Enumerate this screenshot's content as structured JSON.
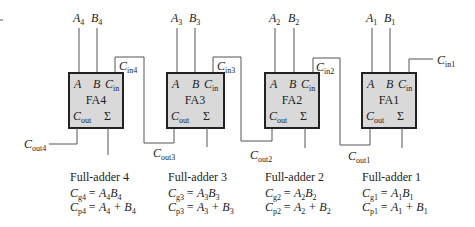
{
  "diagram": {
    "colors": {
      "box_fill": "#d9d9d9",
      "box_stroke": "#222222",
      "wire": "#555555",
      "text": "#222222"
    },
    "adders": [
      {
        "id": "FA4",
        "name": "FA4",
        "caption": "Full-adder 4",
        "input_a": "A",
        "input_a_sub": "4",
        "input_b": "B",
        "input_b_sub": "4",
        "port_a": "A",
        "port_b": "B",
        "port_cin": "C",
        "port_cin_sub": "in",
        "port_cout": "C",
        "port_cout_sub": "out",
        "port_sum": "Σ",
        "cin_label": "C",
        "cin_label_sub": "in4",
        "cout_label": "C",
        "cout_label_sub": "out4",
        "gen_lhs": "C",
        "gen_lhs_sub": "g4",
        "gen_rhs": "= A",
        "gen_rhs_sub1": "4",
        "gen_rhs2": "B",
        "gen_rhs_sub2": "4",
        "prop_lhs": "C",
        "prop_lhs_sub": "p4",
        "prop_rhs": "= A",
        "prop_rhs_sub1": "4",
        "prop_rhs2": " + B",
        "prop_rhs_sub2": "4"
      },
      {
        "id": "FA3",
        "name": "FA3",
        "caption": "Full-adder 3",
        "input_a": "A",
        "input_a_sub": "3",
        "input_b": "B",
        "input_b_sub": "3",
        "port_a": "A",
        "port_b": "B",
        "port_cin": "C",
        "port_cin_sub": "in",
        "port_cout": "C",
        "port_cout_sub": "out",
        "port_sum": "Σ",
        "cin_label": "C",
        "cin_label_sub": "in3",
        "cout_label": "C",
        "cout_label_sub": "out3",
        "gen_lhs": "C",
        "gen_lhs_sub": "g3",
        "gen_rhs": "= A",
        "gen_rhs_sub1": "3",
        "gen_rhs2": "B",
        "gen_rhs_sub2": "3",
        "prop_lhs": "C",
        "prop_lhs_sub": "p3",
        "prop_rhs": "= A",
        "prop_rhs_sub1": "3",
        "prop_rhs2": " + B",
        "prop_rhs_sub2": "3"
      },
      {
        "id": "FA2",
        "name": "FA2",
        "caption": "Full-adder 2",
        "input_a": "A",
        "input_a_sub": "2",
        "input_b": "B",
        "input_b_sub": "2",
        "port_a": "A",
        "port_b": "B",
        "port_cin": "C",
        "port_cin_sub": "in",
        "port_cout": "C",
        "port_cout_sub": "out",
        "port_sum": "Σ",
        "cin_label": "C",
        "cin_label_sub": "in2",
        "cout_label": "C",
        "cout_label_sub": "out2",
        "gen_lhs": "C",
        "gen_lhs_sub": "g2",
        "gen_rhs": "= A",
        "gen_rhs_sub1": "2",
        "gen_rhs2": "B",
        "gen_rhs_sub2": "2",
        "prop_lhs": "C",
        "prop_lhs_sub": "p2",
        "prop_rhs": "= A",
        "prop_rhs_sub1": "2",
        "prop_rhs2": " + B",
        "prop_rhs_sub2": "2"
      },
      {
        "id": "FA1",
        "name": "FA1",
        "caption": "Full-adder 1",
        "input_a": "A",
        "input_a_sub": "1",
        "input_b": "B",
        "input_b_sub": "1",
        "port_a": "A",
        "port_b": "B",
        "port_cin": "C",
        "port_cin_sub": "in",
        "port_cout": "C",
        "port_cout_sub": "out",
        "port_sum": "Σ",
        "cin_label": "C",
        "cin_label_sub": "in1",
        "cout_label": "C",
        "cout_label_sub": "out1",
        "gen_lhs": "C",
        "gen_lhs_sub": "g1",
        "gen_rhs": "= A",
        "gen_rhs_sub1": "1",
        "gen_rhs2": "B",
        "gen_rhs_sub2": "1",
        "prop_lhs": "C",
        "prop_lhs_sub": "p1",
        "prop_rhs": "= A",
        "prop_rhs_sub1": "1",
        "prop_rhs2": " + B",
        "prop_rhs_sub2": "1"
      }
    ]
  }
}
